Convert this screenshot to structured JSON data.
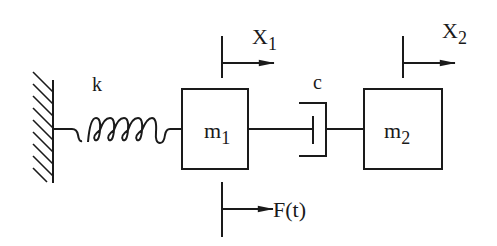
{
  "diagram": {
    "labels": {
      "spring": "k",
      "damper": "c",
      "mass1_main": "m",
      "mass1_sub": "1",
      "mass2_main": "m",
      "mass2_sub": "2",
      "disp1_main": "X",
      "disp1_sub": "1",
      "disp2_main": "X",
      "disp2_sub": "2",
      "force": "F(t)"
    },
    "colors": {
      "stroke": "#1a1a1a",
      "background": "#ffffff"
    }
  }
}
